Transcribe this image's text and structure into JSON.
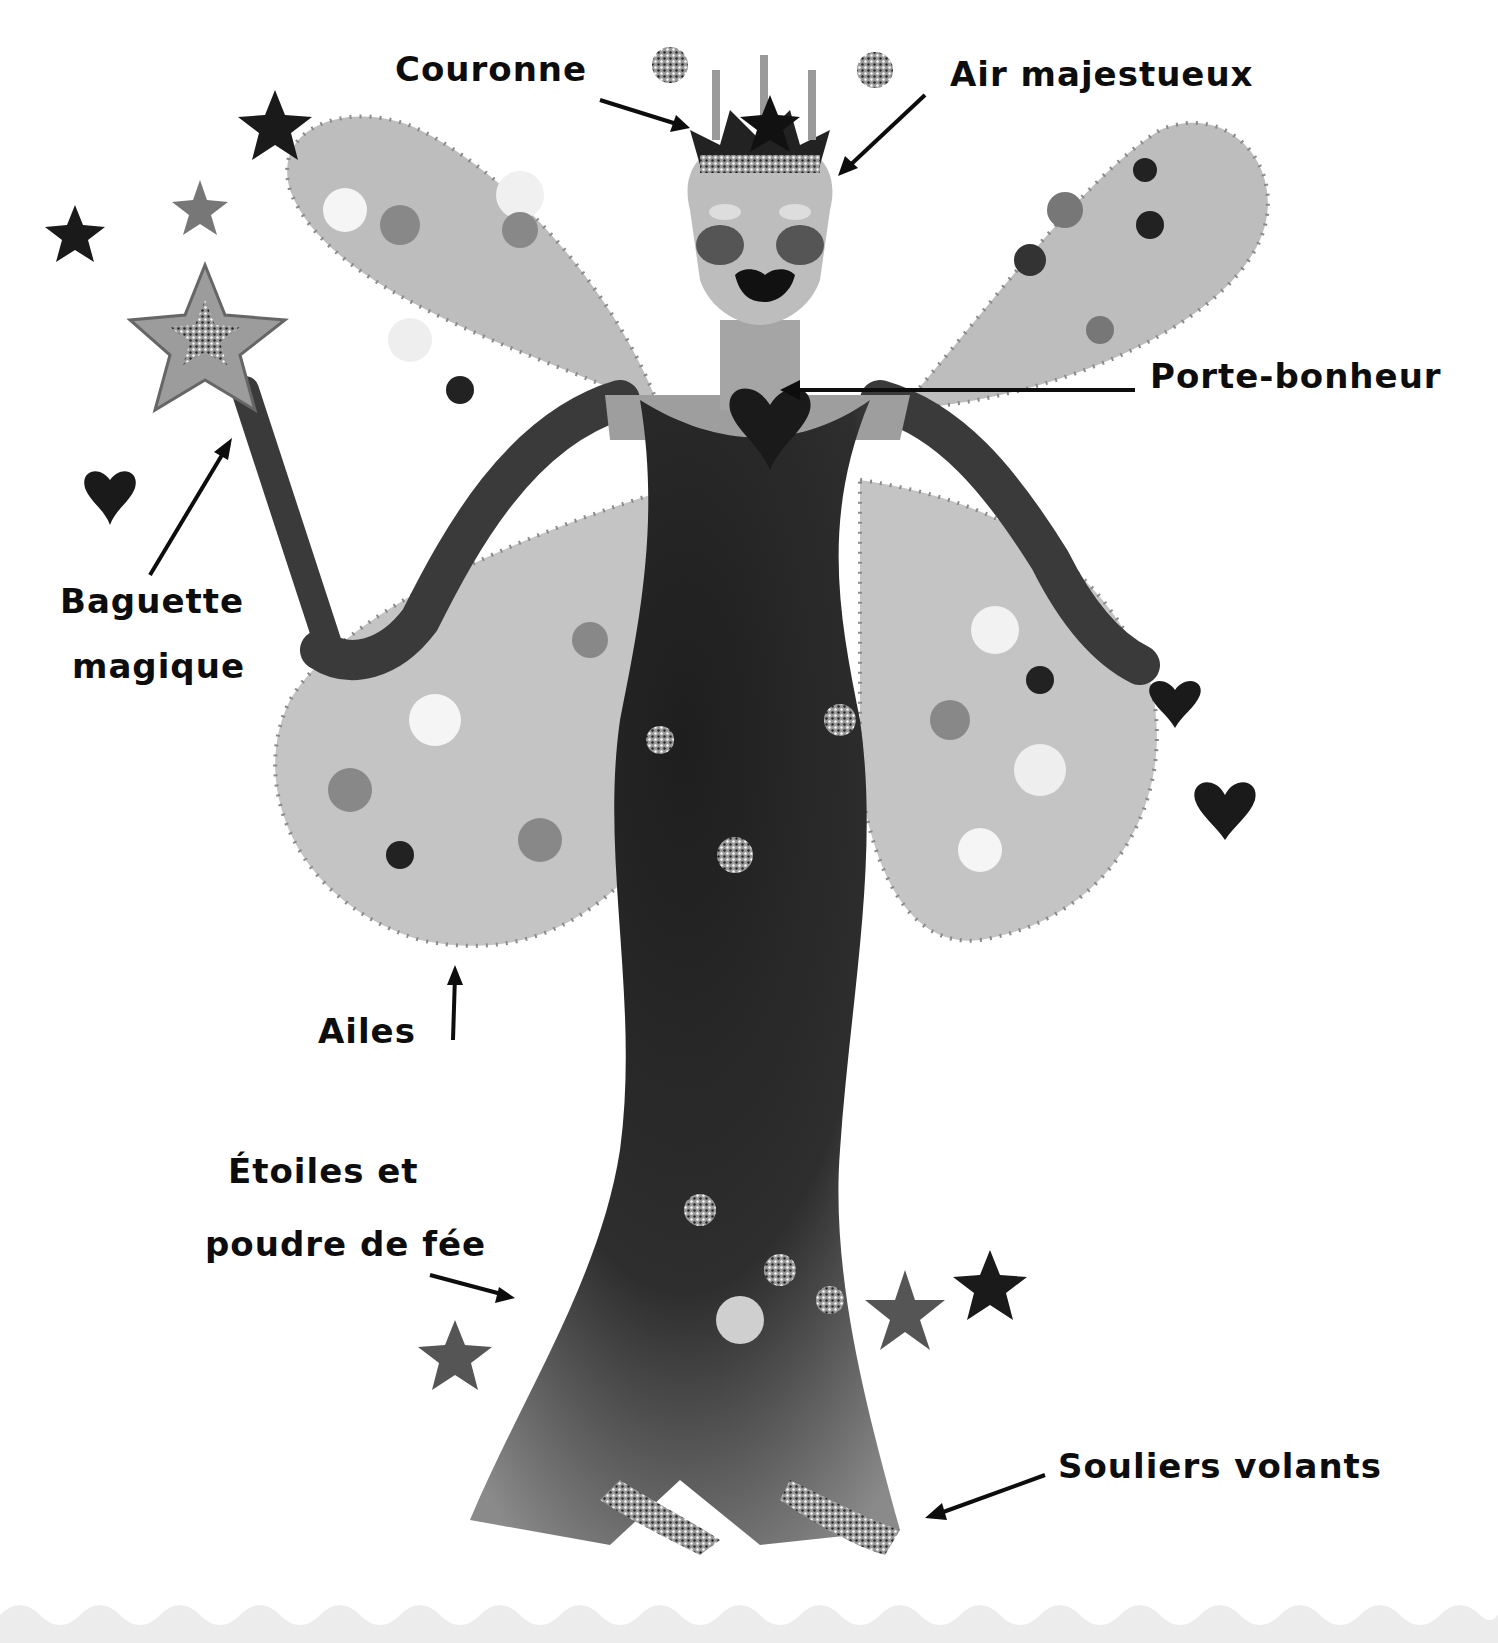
{
  "illustration": {
    "subject": "fairy",
    "palette": {
      "ink": "#0d0d0d",
      "dark": "#2a2a2a",
      "mid": "#8a8a8a",
      "light": "#c8c8c8",
      "pale": "#e6e6e6",
      "wave": "#ececec"
    }
  },
  "labels": {
    "crown": "Couronne",
    "majestic_air": "Air majestueux",
    "lucky_charm": "Porte-bonheur",
    "wand_line1": "Baguette",
    "wand_line2": "magique",
    "wings": "Ailes",
    "stars_line1": "Étoiles et",
    "stars_line2": "poudre de fée",
    "flying_shoes": "Souliers volants"
  }
}
